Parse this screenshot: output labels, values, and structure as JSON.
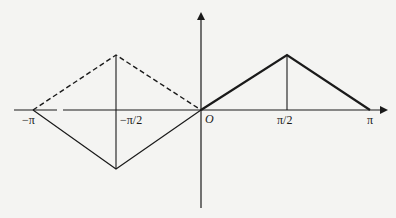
{
  "figure": {
    "type": "piecewise-linear function graph",
    "axes": {
      "x_ticks": [
        {
          "label": "−π",
          "value": -3.1416
        },
        {
          "label": "−π/2",
          "value": -1.5708
        },
        {
          "label": "π/2",
          "value": 1.5708
        },
        {
          "label": "π",
          "value": 3.1416
        }
      ],
      "origin_label": "O"
    },
    "segments": {
      "solid_bold": {
        "style": "solid-thick",
        "points": [
          [
            "0",
            "0"
          ],
          [
            "π/2",
            "peak"
          ],
          [
            "π",
            "0"
          ]
        ]
      },
      "solid_thin_left": {
        "style": "solid-thin",
        "points": [
          [
            "−π",
            "0"
          ],
          [
            "−π/2",
            "trough"
          ],
          [
            "0",
            "0"
          ]
        ]
      },
      "dashed_left": {
        "style": "dashed",
        "points": [
          [
            "−π",
            "0"
          ],
          [
            "−π/2",
            "peak"
          ],
          [
            "0",
            "0"
          ]
        ]
      },
      "vertical_guides": [
        {
          "x": "−π/2",
          "style": "solid-thin"
        },
        {
          "x": "π/2",
          "style": "solid-thin"
        }
      ]
    },
    "colors": {
      "line": "#1a1a1a",
      "background": "#f4f4f2"
    }
  },
  "labels": {
    "neg_pi": "−π",
    "neg_pi_half": "−π/2",
    "origin": "O",
    "pi_half": "π/2",
    "pi": "π"
  }
}
